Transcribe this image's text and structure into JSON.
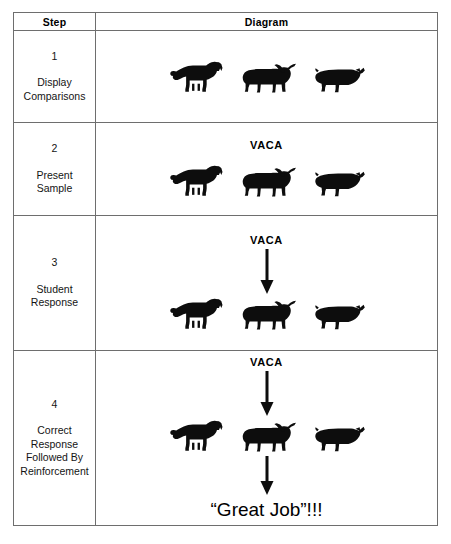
{
  "document": {
    "title": "Discrete trial teaching sequence",
    "background_color": "#ffffff",
    "ink_color": "#000000",
    "border_color": "#6e6e6e"
  },
  "table": {
    "headers": {
      "step": "Step",
      "diagram": "Diagram"
    },
    "rows": [
      {
        "number": "1",
        "label": "Display\nComparisons",
        "cue_word": "",
        "show_cue": false,
        "show_arrow_top": false,
        "show_arrow_bottom": false,
        "praise": "",
        "show_praise": false,
        "animals": [
          {
            "name": "dog",
            "highlighted": false
          },
          {
            "name": "cow",
            "highlighted": false
          },
          {
            "name": "pig",
            "highlighted": false
          }
        ]
      },
      {
        "number": "2",
        "label": "Present\nSample",
        "cue_word": "VACA",
        "show_cue": true,
        "show_arrow_top": false,
        "show_arrow_bottom": false,
        "praise": "",
        "show_praise": false,
        "animals": [
          {
            "name": "dog",
            "highlighted": false
          },
          {
            "name": "cow",
            "highlighted": false
          },
          {
            "name": "pig",
            "highlighted": false
          }
        ]
      },
      {
        "number": "3",
        "label": "Student\nResponse",
        "cue_word": "VACA",
        "show_cue": true,
        "show_arrow_top": true,
        "show_arrow_bottom": false,
        "praise": "",
        "show_praise": false,
        "animals": [
          {
            "name": "dog",
            "highlighted": false
          },
          {
            "name": "cow",
            "highlighted": true
          },
          {
            "name": "pig",
            "highlighted": false
          }
        ]
      },
      {
        "number": "4",
        "label": "Correct\nResponse\nFollowed By\nReinforcement",
        "cue_word": "VACA",
        "show_cue": true,
        "show_arrow_top": true,
        "show_arrow_bottom": true,
        "praise": "“Great Job”!!!",
        "show_praise": true,
        "animals": [
          {
            "name": "dog",
            "highlighted": false
          },
          {
            "name": "cow",
            "highlighted": true
          },
          {
            "name": "pig",
            "highlighted": false
          }
        ]
      }
    ]
  },
  "icons": {
    "dog": "dog-silhouette-icon",
    "cow": "cow-silhouette-icon",
    "pig": "pig-silhouette-icon",
    "arrow": "down-arrow-icon"
  }
}
